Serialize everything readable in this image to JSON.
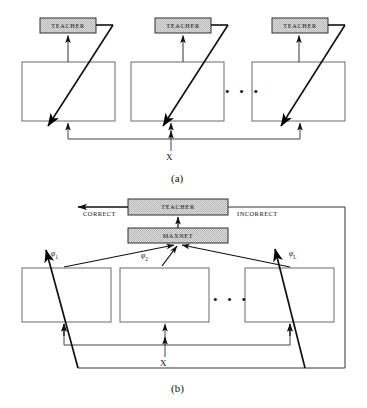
{
  "figure": {
    "panel_a": {
      "label": "(a)",
      "teacher_boxes": [
        {
          "label": "TEACHER"
        },
        {
          "label": "TEACHER"
        },
        {
          "label": "TEACHER"
        }
      ],
      "network_boxes": [
        {
          "label": ""
        },
        {
          "label": ""
        },
        {
          "label": ""
        }
      ],
      "ellipsis": "•  •  •",
      "input_label": "X"
    },
    "panel_b": {
      "label": "(b)",
      "teacher_box": {
        "label": "TEACHER"
      },
      "maxnet_box": {
        "label": "MAXNET"
      },
      "correct_label": "CORRECT",
      "incorrect_label": "INCORRECT",
      "phi_labels": [
        {
          "symbol": "φ",
          "sub": "1"
        },
        {
          "symbol": "φ",
          "sub": "2"
        },
        {
          "symbol": "φ",
          "sub": "L"
        }
      ],
      "network_boxes": [
        {
          "label": ""
        },
        {
          "label": ""
        },
        {
          "label": ""
        }
      ],
      "ellipsis": "•  •  •",
      "input_label": "X"
    },
    "colors": {
      "stroke": "#3a3a3a",
      "arrow": "#000000",
      "box_fill": "#ffffff",
      "shaded_fill": "#d6d6d6",
      "background": "#ffffff"
    }
  }
}
